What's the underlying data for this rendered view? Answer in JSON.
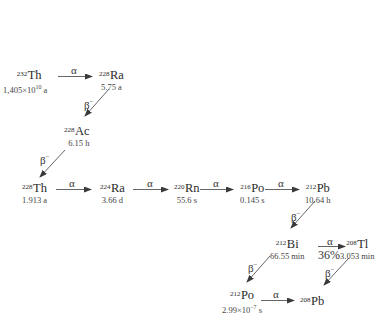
{
  "diagram": {
    "type": "decay-chain",
    "nuclides": [
      {
        "id": "th232",
        "mass": "232",
        "symbol": "Th",
        "half_life": "1,405×10",
        "half_life_exp": "10",
        "half_life_unit": " a"
      },
      {
        "id": "ra228",
        "mass": "228",
        "symbol": "Ra",
        "half_life": "5.75 a"
      },
      {
        "id": "ac228",
        "mass": "228",
        "symbol": "Ac",
        "half_life": "6.15 h"
      },
      {
        "id": "th228",
        "mass": "228",
        "symbol": "Th",
        "half_life": "1.913 a"
      },
      {
        "id": "ra224",
        "mass": "224",
        "symbol": "Ra",
        "half_life": "3.66 d"
      },
      {
        "id": "rn220",
        "mass": "220",
        "symbol": "Rn",
        "half_life": "55.6 s"
      },
      {
        "id": "po216",
        "mass": "216",
        "symbol": "Po",
        "half_life": "0.145 s"
      },
      {
        "id": "pb212",
        "mass": "212",
        "symbol": "Pb",
        "half_life": "10.64 h"
      },
      {
        "id": "bi212",
        "mass": "212",
        "symbol": "Bi",
        "half_life": "66.55 min"
      },
      {
        "id": "tl208",
        "mass": "208",
        "symbol": "Tl",
        "half_life": "3.053 min"
      },
      {
        "id": "po212",
        "mass": "212",
        "symbol": "Po",
        "half_life": "2.99×10",
        "half_life_exp": "−7",
        "half_life_unit": " s"
      },
      {
        "id": "pb208",
        "mass": "208",
        "symbol": "Pb",
        "half_life": ""
      }
    ],
    "decays": [
      {
        "from": "th232",
        "to": "ra228",
        "mode": "α",
        "mode_sup": ""
      },
      {
        "from": "ra228",
        "to": "ac228",
        "mode": "β",
        "mode_sup": "−"
      },
      {
        "from": "ac228",
        "to": "th228",
        "mode": "β",
        "mode_sup": "−"
      },
      {
        "from": "th228",
        "to": "ra224",
        "mode": "α",
        "mode_sup": ""
      },
      {
        "from": "ra224",
        "to": "rn220",
        "mode": "α",
        "mode_sup": ""
      },
      {
        "from": "rn220",
        "to": "po216",
        "mode": "α",
        "mode_sup": ""
      },
      {
        "from": "po216",
        "to": "pb212",
        "mode": "α",
        "mode_sup": ""
      },
      {
        "from": "pb212",
        "to": "bi212",
        "mode": "β",
        "mode_sup": "−"
      },
      {
        "from": "bi212",
        "to": "tl208",
        "mode": "α",
        "mode_sup": "",
        "branch": "36%"
      },
      {
        "from": "bi212",
        "to": "po212",
        "mode": "β",
        "mode_sup": "−"
      },
      {
        "from": "tl208",
        "to": "pb208",
        "mode": "β",
        "mode_sup": "−"
      },
      {
        "from": "po212",
        "to": "pb208",
        "mode": "α",
        "mode_sup": ""
      }
    ],
    "colors": {
      "text": "#333333",
      "arrow": "#444444",
      "background": "#ffffff"
    }
  }
}
